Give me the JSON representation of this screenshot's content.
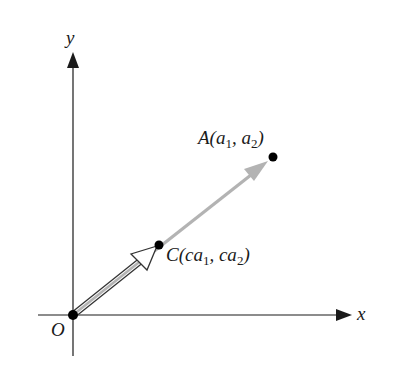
{
  "diagram": {
    "type": "vector-scalar-multiple",
    "axes": {
      "x_label": "x",
      "y_label": "y",
      "origin_label": "O"
    },
    "points": {
      "A": {
        "name": "A",
        "label_parts": [
          "A(a",
          "1",
          ", a",
          "2",
          ")"
        ]
      },
      "C": {
        "name": "C",
        "label_parts": [
          "C(ca",
          "1",
          ", ca",
          "2",
          ")"
        ]
      },
      "O": {
        "name": "O"
      }
    },
    "vectors": [
      {
        "from": "O",
        "to": "A",
        "style": "gray-solid-arrow"
      },
      {
        "from": "O",
        "to": "C",
        "style": "hollow-outlined-arrow"
      }
    ],
    "colors": {
      "axis": "#1a1a1a",
      "vector_OA": "#b3b3b3",
      "vector_OC_outline": "#333333",
      "point": "#000000"
    }
  }
}
